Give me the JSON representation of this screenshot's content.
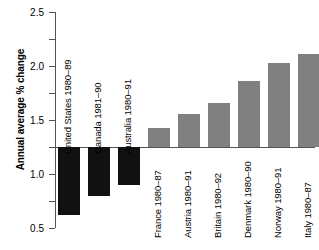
{
  "chart_data": {
    "type": "bar",
    "title": "",
    "subtitle": "",
    "xlabel": "",
    "ylabel": "Annual average % change",
    "ylim": [
      -1.5,
      2.5
    ],
    "ytick_labels": [
      "2.5",
      "2.0",
      "1.5",
      "1.0",
      "0.5",
      "0",
      "-0.5",
      "-1.0",
      "-1.5"
    ],
    "ytick_values": [
      2.5,
      2.0,
      1.5,
      1.0,
      0.5,
      0,
      -0.5,
      -1.0,
      -1.5
    ],
    "grid": false,
    "legend": "none",
    "colors": {
      "negative": "#111111",
      "positive": "#808080",
      "axis": "#555555",
      "background": "#ffffff"
    },
    "categories": [
      "United States 1980–89",
      "Canada 1981–90",
      "Australia 1980–91",
      "France 1980–87",
      "Austria 1980–91",
      "Britain 1980–92",
      "Denmark 1980–90",
      "Norway 1980–91",
      "Italy 1980–87",
      "Sweden 1981–91",
      "Germany 1983–90"
    ],
    "values": [
      -1.25,
      -0.9,
      -0.7,
      0.35,
      0.62,
      0.82,
      1.22,
      1.55,
      1.72,
      1.72,
      2.5
    ],
    "bars": [
      {
        "label": "United States 1980–89",
        "value": -1.25,
        "sign": "negative",
        "label_position": "above-axis"
      },
      {
        "label": "Canada 1981–90",
        "value": -0.9,
        "sign": "negative",
        "label_position": "above-axis"
      },
      {
        "label": "Australia 1980–91",
        "value": -0.7,
        "sign": "negative",
        "label_position": "above-axis"
      },
      {
        "label": "France 1980–87",
        "value": 0.35,
        "sign": "positive",
        "label_position": "below-axis"
      },
      {
        "label": "Austria 1980–91",
        "value": 0.62,
        "sign": "positive",
        "label_position": "below-axis"
      },
      {
        "label": "Britain 1980–92",
        "value": 0.82,
        "sign": "positive",
        "label_position": "below-axis"
      },
      {
        "label": "Denmark 1980–90",
        "value": 1.22,
        "sign": "positive",
        "label_position": "below-axis"
      },
      {
        "label": "Norway 1980–91",
        "value": 1.55,
        "sign": "positive",
        "label_position": "below-axis"
      },
      {
        "label": "Italy 1980–87",
        "value": 1.72,
        "sign": "positive",
        "label_position": "below-axis"
      },
      {
        "label": "Sweden 1981–91",
        "value": 1.72,
        "sign": "positive",
        "label_position": "below-axis"
      },
      {
        "label": "Germany 1983–90",
        "value": 2.5,
        "sign": "positive",
        "label_position": "below-axis"
      }
    ]
  }
}
